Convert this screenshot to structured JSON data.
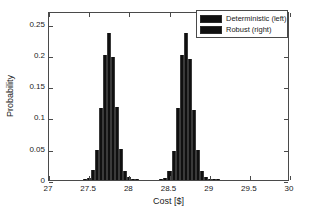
{
  "chart_data": {
    "type": "bar",
    "title": "",
    "subtitle": "",
    "xlabel": "Cost [$]",
    "ylabel": "Probability",
    "xlim": [
      27,
      30
    ],
    "ylim": [
      0,
      0.27
    ],
    "xticks": [
      "27",
      "27.5",
      "28",
      "28.5",
      "29",
      "29.5",
      "30"
    ],
    "xtick_values": [
      27,
      27.5,
      28,
      28.5,
      29,
      29.5,
      30
    ],
    "yticks": [
      "0",
      "0.05",
      "0.1",
      "0.15",
      "0.2",
      "0.25"
    ],
    "ytick_values": [
      0,
      0.05,
      0.1,
      0.15,
      0.2,
      0.25
    ],
    "grid": false,
    "legend_position": "top-right",
    "legend": [
      "Deterministic (left)",
      "Robust (right)"
    ],
    "bar_width": 0.05,
    "series": [
      {
        "name": "Deterministic (left)",
        "x": [
          27.45,
          27.5,
          27.55,
          27.6,
          27.65,
          27.7,
          27.75,
          27.8,
          27.85,
          27.9,
          27.95,
          28.0,
          28.05,
          28.1
        ],
        "values": [
          0.002,
          0.004,
          0.016,
          0.048,
          0.115,
          0.199,
          0.235,
          0.196,
          0.116,
          0.05,
          0.015,
          0.005,
          0.002,
          0.001
        ]
      },
      {
        "name": "Robust (right)",
        "x": [
          28.4,
          28.45,
          28.5,
          28.55,
          28.6,
          28.65,
          28.7,
          28.75,
          28.8,
          28.85,
          28.9,
          28.95,
          29.0,
          29.05,
          29.1
        ],
        "values": [
          0.002,
          0.004,
          0.015,
          0.047,
          0.115,
          0.199,
          0.235,
          0.193,
          0.112,
          0.048,
          0.015,
          0.005,
          0.002,
          0.001,
          0.001
        ]
      }
    ]
  },
  "colors": {
    "bar": "#101010",
    "axis": "#4a4a4a",
    "text": "#1a1a1a",
    "background": "#ffffff"
  }
}
